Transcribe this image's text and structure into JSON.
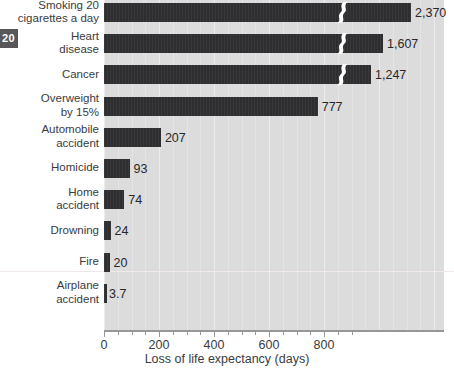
{
  "page_badge": {
    "number": "20"
  },
  "chart_data": {
    "type": "bar",
    "orientation": "horizontal",
    "title": "",
    "xlabel": "Loss of life expectancy (days)",
    "ylabel": "",
    "xlim": [
      0,
      900
    ],
    "xticks": [
      0,
      200,
      400,
      600,
      800
    ],
    "xticklabels": [
      "0",
      "200",
      "400",
      "600",
      "800"
    ],
    "grid": true,
    "axis_break": {
      "present": true,
      "note": "Top three bars are truncated with a zig-zag break; their true values exceed the axis range.",
      "applies_to": [
        "Smoking 20 cigarettes a day",
        "Heart disease",
        "Cancer"
      ]
    },
    "categories": [
      "Smoking 20\ncigarettes a day",
      "Heart\ndisease",
      "Cancer",
      "Overweight\nby 15%",
      "Automobile\naccident",
      "Homicide",
      "Home\naccident",
      "Drowning",
      "Fire",
      "Airplane\naccident"
    ],
    "values": [
      2370,
      1607,
      1247,
      777,
      207,
      93,
      74,
      24,
      20,
      3.7
    ],
    "value_labels": [
      "2,370",
      "1,607",
      "1,247",
      "777",
      "207",
      "93",
      "74",
      "24",
      "20",
      "3.7"
    ],
    "bar_color": "#2e2e30",
    "plot_background": "#dcdcdc",
    "gridline_color": "#ececed",
    "axis_color": "#97979a",
    "text_color": "#3b3b3d"
  }
}
